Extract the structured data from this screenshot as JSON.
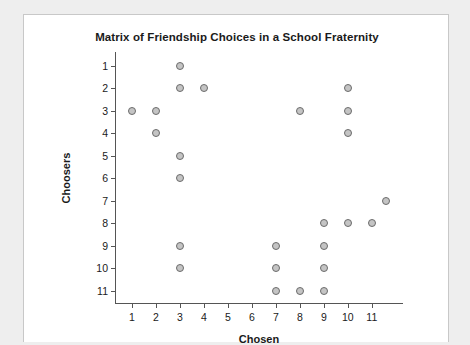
{
  "chart_data": {
    "type": "scatter",
    "title": "Matrix of Friendship Choices in a School Fraternity",
    "xlabel": "Chosen",
    "ylabel": "Choosers",
    "xticks": [
      1,
      2,
      3,
      4,
      5,
      6,
      7,
      8,
      9,
      10,
      11
    ],
    "yticks": [
      1,
      2,
      3,
      4,
      5,
      6,
      7,
      8,
      9,
      10,
      11
    ],
    "xlim": [
      0.3,
      12.3
    ],
    "ylim": [
      0.4,
      11.6
    ],
    "y_axis_inverted": true,
    "grid": false,
    "legend": null,
    "marker": {
      "shape": "circle",
      "fill": "#c4c4c4",
      "edge": "#6b6b6b",
      "size": 8
    },
    "points": [
      {
        "chooser": 1,
        "chosen": 3
      },
      {
        "chooser": 2,
        "chosen": 3
      },
      {
        "chooser": 2,
        "chosen": 4
      },
      {
        "chooser": 2,
        "chosen": 10
      },
      {
        "chooser": 3,
        "chosen": 1
      },
      {
        "chooser": 3,
        "chosen": 2
      },
      {
        "chooser": 3,
        "chosen": 8
      },
      {
        "chooser": 3,
        "chosen": 10
      },
      {
        "chooser": 4,
        "chosen": 2
      },
      {
        "chooser": 4,
        "chosen": 10
      },
      {
        "chooser": 5,
        "chosen": 3
      },
      {
        "chooser": 6,
        "chosen": 3
      },
      {
        "chooser": 7,
        "chosen": 11.6
      },
      {
        "chooser": 8,
        "chosen": 9
      },
      {
        "chooser": 8,
        "chosen": 10
      },
      {
        "chooser": 8,
        "chosen": 11
      },
      {
        "chooser": 9,
        "chosen": 3
      },
      {
        "chooser": 9,
        "chosen": 7
      },
      {
        "chooser": 9,
        "chosen": 9
      },
      {
        "chooser": 10,
        "chosen": 3
      },
      {
        "chooser": 10,
        "chosen": 7
      },
      {
        "chooser": 10,
        "chosen": 9
      },
      {
        "chooser": 11,
        "chosen": 7
      },
      {
        "chooser": 11,
        "chosen": 8
      },
      {
        "chooser": 11,
        "chosen": 9
      }
    ]
  }
}
